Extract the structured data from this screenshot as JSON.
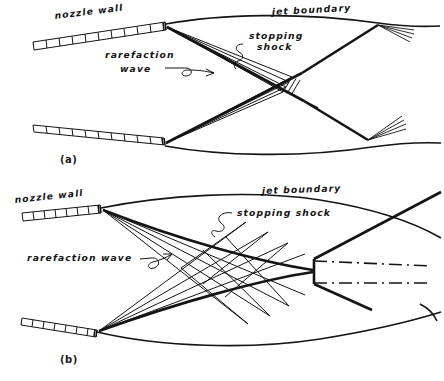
{
  "figure": {
    "kind": "hand-drawn-schematic",
    "ink_color": "#141414",
    "background_color": "#ffffff",
    "panels": [
      {
        "id": "a",
        "panel_label": "(a)",
        "labels": {
          "nozzle_wall": "nozzle wall",
          "jet_boundary": "jet boundary",
          "stopping_shock_line1": "stopping",
          "stopping_shock_line2": "shock",
          "rarefaction_line1": "rarefaction",
          "rarefaction_line2": "wave"
        },
        "features": [
          "upper nozzle wall hatched band",
          "lower nozzle wall hatched band",
          "upper jet boundary curve",
          "lower jet boundary curve",
          "rarefaction wave fan from upper lip",
          "rarefaction wave fan from lower lip",
          "stopping shock crossing pair",
          "reflected shock fans at boundaries"
        ]
      },
      {
        "id": "b",
        "panel_label": "(b)",
        "labels": {
          "nozzle_wall": "nozzle wall",
          "jet_boundary": "jet boundary",
          "stopping_shock": "stopping shock",
          "rarefaction_wave": "rarefaction wave"
        },
        "features": [
          "upper nozzle wall hatched band",
          "lower nozzle wall hatched band",
          "upper jet boundary curve",
          "lower jet boundary curve",
          "rarefaction wave fan from upper lip",
          "rarefaction wave fan from lower lip",
          "characteristic criss-cross grid",
          "stopping shock envelope",
          "mach disk vertical segment",
          "slip lines dash-dot pair"
        ]
      }
    ]
  }
}
